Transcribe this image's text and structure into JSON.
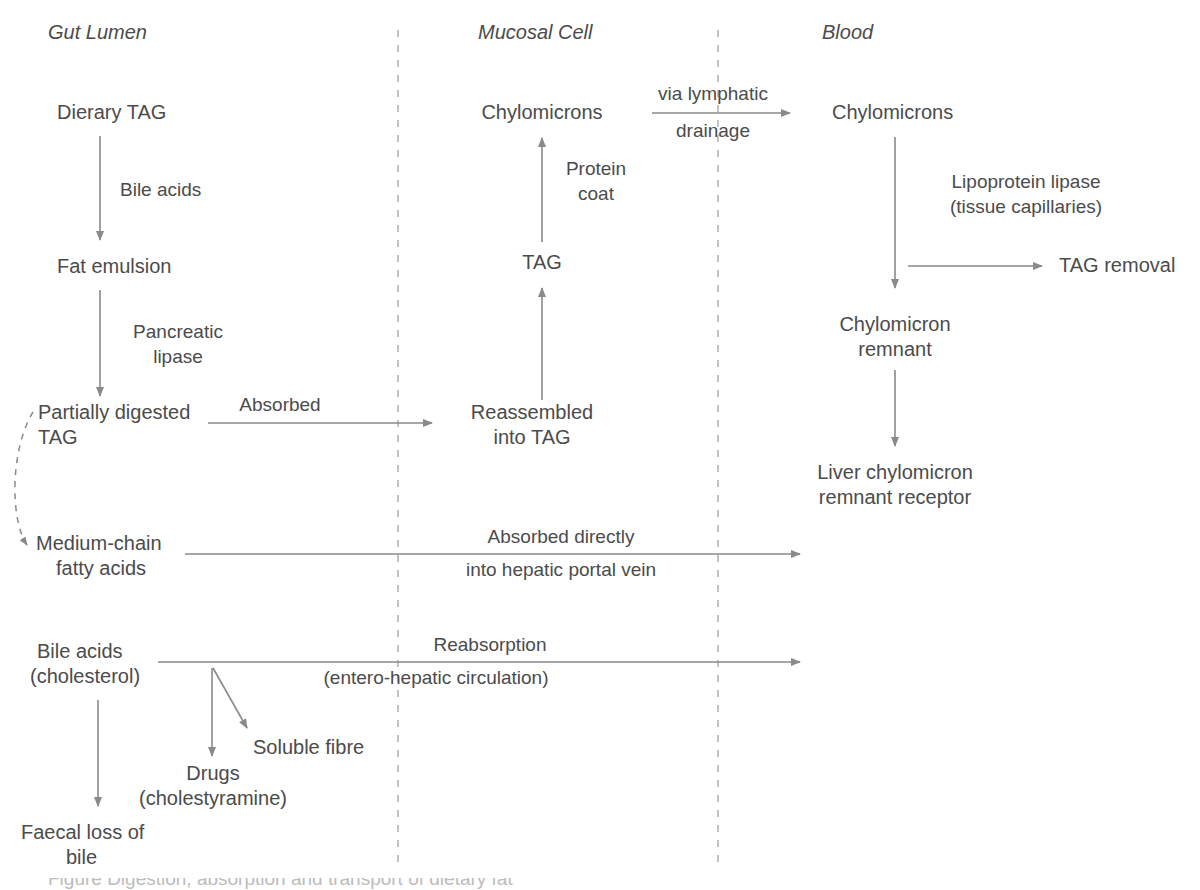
{
  "diagram": {
    "title": "Digestion, absorption and transport of dietary fat",
    "background_color": "#ffffff",
    "text_color": "#4b4b4b",
    "line_color": "#8a8a8a",
    "divider_color": "#b4b4b4",
    "columns": [
      {
        "id": "gut-lumen",
        "label": "Gut Lumen"
      },
      {
        "id": "mucosal-cell",
        "label": "Mucosal Cell"
      },
      {
        "id": "blood",
        "label": "Blood"
      }
    ],
    "dividers": [
      {
        "id": "divider-gut-mucosa",
        "x": 398
      },
      {
        "id": "divider-mucosa-blood",
        "x": 718
      }
    ],
    "nodes": [
      {
        "id": "dietary-tag",
        "text": "Dierary TAG"
      },
      {
        "id": "fat-emulsion",
        "text": "Fat emulsion"
      },
      {
        "id": "partially-digested-tag-l1",
        "text": "Partially digested"
      },
      {
        "id": "partially-digested-tag-l2",
        "text": "TAG"
      },
      {
        "id": "medium-chain-fa-l1",
        "text": "Medium-chain"
      },
      {
        "id": "medium-chain-fa-l2",
        "text": "fatty acids"
      },
      {
        "id": "bile-acids-chol-l1",
        "text": "Bile acids"
      },
      {
        "id": "bile-acids-chol-l2",
        "text": "(cholesterol)"
      },
      {
        "id": "drugs-l1",
        "text": "Drugs"
      },
      {
        "id": "drugs-l2",
        "text": "(cholestyramine)"
      },
      {
        "id": "soluble-fibre",
        "text": "Soluble fibre"
      },
      {
        "id": "faecal-loss-l1",
        "text": "Faecal loss of"
      },
      {
        "id": "faecal-loss-l2",
        "text": "bile"
      },
      {
        "id": "chylomicrons-mucosal",
        "text": "Chylomicrons"
      },
      {
        "id": "tag-mucosal",
        "text": "TAG"
      },
      {
        "id": "reassembled-tag-l1",
        "text": "Reassembled"
      },
      {
        "id": "reassembled-tag-l2",
        "text": "into TAG"
      },
      {
        "id": "chylomicrons-blood",
        "text": "Chylomicrons"
      },
      {
        "id": "tag-removal",
        "text": "TAG removal"
      },
      {
        "id": "chylomicron-remnant-l1",
        "text": "Chylomicron"
      },
      {
        "id": "chylomicron-remnant-l2",
        "text": "remnant"
      },
      {
        "id": "liver-receptor-l1",
        "text": "Liver chylomicron"
      },
      {
        "id": "liver-receptor-l2",
        "text": "remnant receptor"
      }
    ],
    "edge_labels": [
      {
        "id": "bile-acids-label",
        "text": "Bile acids"
      },
      {
        "id": "pancreatic-lipase-l1",
        "text": "Pancreatic"
      },
      {
        "id": "pancreatic-lipase-l2",
        "text": "lipase"
      },
      {
        "id": "absorbed-label",
        "text": "Absorbed"
      },
      {
        "id": "protein-coat-l1",
        "text": "Protein"
      },
      {
        "id": "protein-coat-l2",
        "text": "coat"
      },
      {
        "id": "via-lymphatic-l1",
        "text": "via lymphatic"
      },
      {
        "id": "via-lymphatic-l2",
        "text": "drainage"
      },
      {
        "id": "lipoprotein-lipase-l1",
        "text": "Lipoprotein lipase"
      },
      {
        "id": "lipoprotein-lipase-l2",
        "text": "(tissue capillaries)"
      },
      {
        "id": "absorbed-directly-l1",
        "text": "Absorbed directly"
      },
      {
        "id": "absorbed-directly-l2",
        "text": "into hepatic portal vein"
      },
      {
        "id": "reabsorption-l1",
        "text": "Reabsorption"
      },
      {
        "id": "reabsorption-l2",
        "text": "(entero-hepatic circulation)"
      }
    ],
    "caption_partial": "Figure Digestion, absorption and transport of dietary fat"
  }
}
